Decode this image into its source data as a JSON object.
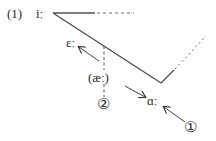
{
  "diagram": {
    "example_number": "(1)",
    "vowels": {
      "i": "iː",
      "e": "ɛː",
      "ae": "(æː)",
      "a": "ɑː"
    },
    "steps": {
      "one": "①",
      "two": "②"
    },
    "colors": {
      "line": "#3a3a3a",
      "text": "#2a2a2a",
      "background": "#ffffff"
    }
  }
}
